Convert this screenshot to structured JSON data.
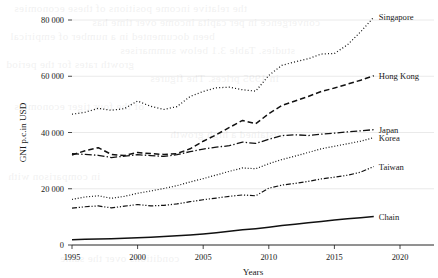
{
  "figure": {
    "background_color": "#ffffff",
    "ink_color": "#111111",
    "grid_color": "#d8d8d8",
    "bleed_through_lines": [
      "the relative income positions of these economies",
      "convergence in per capita income over time has",
      "been documented in a number of empirical",
      "studies. Table 3.1 below summarises",
      "growth rates for the period",
      "in 1995 prices. The figures",
      "of the four tiger economies",
      "sustained a high growth",
      "in comparison with",
      "conditions over the same"
    ]
  },
  "chart_data": {
    "type": "line",
    "title": "",
    "xlabel": "Years",
    "ylabel": "GNI p.c.in USD",
    "xlim": [
      1995,
      2021
    ],
    "ylim": [
      0,
      88000
    ],
    "xticks": [
      1995,
      2000,
      2005,
      2010,
      2015,
      2020
    ],
    "xticklabels": [
      "1995",
      "2000",
      "2005",
      "2010",
      "2015",
      "2020"
    ],
    "yticks": [
      0,
      20000,
      40000,
      60000,
      80000
    ],
    "yticklabels": [
      "0",
      "20 000",
      "40 000",
      "60 000",
      "80 000"
    ],
    "grid": "horizontal",
    "legend_position": "line-end-labels",
    "x": [
      1995,
      1996,
      1997,
      1998,
      1999,
      2000,
      2001,
      2002,
      2003,
      2004,
      2005,
      2006,
      2007,
      2008,
      2009,
      2010,
      2011,
      2012,
      2013,
      2014,
      2015,
      2016,
      2017,
      2018
    ],
    "series": [
      {
        "name": "Singapore",
        "label": "Singapore",
        "linestyle": "dotted",
        "dasharray": "1,2.2",
        "linewidth": 1.25,
        "values": [
          46500,
          47200,
          48600,
          47900,
          48500,
          51200,
          49300,
          48200,
          49200,
          52800,
          54600,
          55900,
          56100,
          55200,
          54700,
          60300,
          63900,
          65100,
          66200,
          67900,
          68100,
          71200,
          75800,
          81000
        ]
      },
      {
        "name": "Hong Kong",
        "label": "Hong Kong",
        "linestyle": "dashed",
        "dasharray": "5.5,3",
        "linewidth": 1.5,
        "values": [
          32000,
          33500,
          34600,
          32200,
          31800,
          32900,
          32500,
          32200,
          32500,
          34200,
          36900,
          39200,
          41800,
          44300,
          43100,
          46700,
          49600,
          51200,
          52800,
          54600,
          55800,
          57200,
          58600,
          60200
        ]
      },
      {
        "name": "Japan",
        "label": "Japan",
        "linestyle": "dashdot",
        "dasharray": "7,2.2,1.4,2.2",
        "linewidth": 1.3,
        "values": [
          32500,
          32200,
          31900,
          31100,
          31600,
          32100,
          31800,
          31500,
          32100,
          33200,
          34100,
          34800,
          35300,
          36600,
          36100,
          37600,
          38900,
          39200,
          38900,
          39400,
          39800,
          40200,
          40600,
          41000
        ]
      },
      {
        "name": "Korea",
        "label": "Korea",
        "linestyle": "dotted",
        "dasharray": "1,1.9",
        "linewidth": 1.2,
        "values": [
          16200,
          17100,
          17500,
          16600,
          17300,
          18400,
          19200,
          20100,
          21100,
          22400,
          23600,
          24900,
          26200,
          27400,
          27100,
          28900,
          30400,
          31600,
          32900,
          34200,
          35100,
          36000,
          36900,
          38200
        ]
      },
      {
        "name": "Taiwan",
        "label": "Taiwan",
        "linestyle": "dashdotdot",
        "dasharray": "5,1.8,1.2,1.8,1.2,1.8",
        "linewidth": 1.2,
        "values": [
          13100,
          13600,
          13900,
          13200,
          13800,
          14400,
          13900,
          14100,
          14600,
          15400,
          16100,
          16700,
          17300,
          17800,
          17500,
          20200,
          21300,
          21900,
          22600,
          23500,
          24100,
          24800,
          25900,
          27900
        ]
      },
      {
        "name": "Chain",
        "label": "Chain",
        "linestyle": "solid",
        "dasharray": "0",
        "linewidth": 1.5,
        "values": [
          1900,
          2050,
          2150,
          2250,
          2400,
          2600,
          2800,
          3000,
          3250,
          3600,
          3950,
          4400,
          4900,
          5400,
          5800,
          6300,
          6900,
          7400,
          7900,
          8400,
          8900,
          9300,
          9700,
          10100
        ]
      }
    ]
  }
}
